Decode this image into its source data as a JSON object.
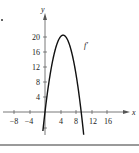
{
  "chart_data": {
    "type": "line",
    "title": "",
    "xlabel": "x",
    "ylabel": "y",
    "xlim": [
      -11,
      21
    ],
    "ylim": [
      -6,
      26
    ],
    "x_ticks": [
      -8,
      -4,
      4,
      8,
      12,
      16
    ],
    "y_ticks": [
      4,
      8,
      12,
      16,
      20
    ],
    "grid": false,
    "legend": null,
    "annotations": [
      {
        "text": "f′",
        "x": 10,
        "y": 19
      }
    ],
    "series": [
      {
        "name": "f′",
        "x": [
          -0.5,
          0,
          1,
          2,
          3,
          4,
          4.7,
          5,
          6,
          7,
          8,
          9,
          9.4,
          10
        ],
        "values": [
          -4.6,
          0,
          7.8,
          13.7,
          17.8,
          20.0,
          20.5,
          20.5,
          19.1,
          15.8,
          10.4,
          3.3,
          0,
          -5.6
        ]
      }
    ],
    "curve_description": "Downward-opening parabola, roots near x=0 and x≈9.4, maximum ≈20.5 near x≈4.7"
  },
  "labels": {
    "x_axis": "x",
    "y_axis": "y",
    "curve": "f′",
    "x_ticks": [
      "−8",
      "−4",
      "4",
      "8",
      "12",
      "16"
    ],
    "y_ticks": [
      "4",
      "8",
      "12",
      "16",
      "20"
    ]
  },
  "colors": {
    "curve": "#111111",
    "axes": "#555555",
    "rule": "#9a9a9a"
  }
}
